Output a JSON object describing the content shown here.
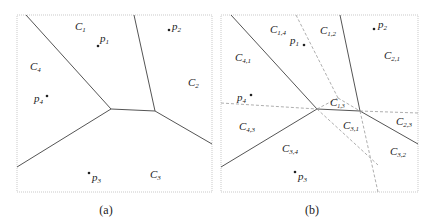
{
  "panels": [
    {
      "caption": "(a)",
      "sites": [
        {
          "name": "p",
          "sub": "1"
        },
        {
          "name": "p",
          "sub": "2"
        },
        {
          "name": "p",
          "sub": "3"
        },
        {
          "name": "p",
          "sub": "4"
        }
      ],
      "cells": [
        {
          "name": "C",
          "sub": "1"
        },
        {
          "name": "C",
          "sub": "2"
        },
        {
          "name": "C",
          "sub": "3"
        },
        {
          "name": "C",
          "sub": "4"
        }
      ]
    },
    {
      "caption": "(b)",
      "sites": [
        {
          "name": "p",
          "sub": "1"
        },
        {
          "name": "p",
          "sub": "2"
        },
        {
          "name": "p",
          "sub": "3"
        },
        {
          "name": "p",
          "sub": "4"
        }
      ],
      "cells": [
        {
          "name": "C",
          "sub": "1,4"
        },
        {
          "name": "C",
          "sub": "1,2"
        },
        {
          "name": "C",
          "sub": "2,1"
        },
        {
          "name": "C",
          "sub": "4,1"
        },
        {
          "name": "C",
          "sub": "1,3"
        },
        {
          "name": "C",
          "sub": "3,1"
        },
        {
          "name": "C",
          "sub": "2,3"
        },
        {
          "name": "C",
          "sub": "4,3"
        },
        {
          "name": "C",
          "sub": "3,4"
        },
        {
          "name": "C",
          "sub": "3,2"
        }
      ]
    }
  ],
  "colors": {
    "edge": "#555555",
    "dashed": "#999999",
    "frame": "#bbbbbb"
  }
}
